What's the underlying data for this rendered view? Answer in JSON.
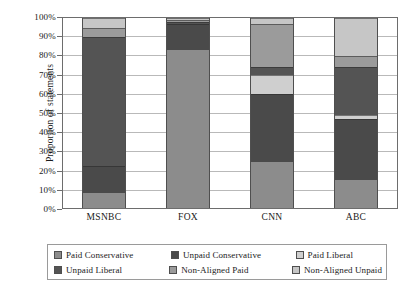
{
  "chart_data": {
    "type": "bar",
    "stacked": true,
    "title": "",
    "xlabel": "",
    "ylabel": "Proportion of statements",
    "ylim": [
      0,
      100
    ],
    "grid": true,
    "legend_position": "bottom",
    "categories": [
      "MSNBC",
      "FOX",
      "CNN",
      "ABC"
    ],
    "ytick_labels": [
      "0%",
      "10%",
      "20%",
      "30%",
      "40%",
      "50%",
      "60%",
      "70%",
      "80%",
      "90%",
      "100%"
    ],
    "ytick_values": [
      0,
      10,
      20,
      30,
      40,
      50,
      60,
      70,
      80,
      90,
      100
    ],
    "series": [
      {
        "name": "Paid Conservative",
        "color": "#8c8c8c",
        "values": [
          8,
          83,
          24,
          15
        ]
      },
      {
        "name": "Unpaid Conservative",
        "color": "#4a4a4a",
        "values": [
          14,
          14,
          36,
          32
        ]
      },
      {
        "name": "Paid Liberal",
        "color": "#cfcfcf",
        "values": [
          0,
          0,
          10,
          2
        ]
      },
      {
        "name": "Unpaid Liberal",
        "color": "#545454",
        "values": [
          68,
          1,
          4,
          25
        ]
      },
      {
        "name": "Non-Aligned Paid",
        "color": "#9b9b9b",
        "values": [
          5,
          1,
          23,
          6
        ]
      },
      {
        "name": "Non-Aligned Unpaid",
        "color": "#c6c6c6",
        "values": [
          5,
          1,
          3,
          20
        ]
      }
    ]
  },
  "legend": {
    "entries": [
      {
        "label": "Paid Conservative"
      },
      {
        "label": "Unpaid Conservative"
      },
      {
        "label": "Paid Liberal"
      },
      {
        "label": "Unpaid Liberal"
      },
      {
        "label": "Non-Aligned Paid"
      },
      {
        "label": "Non-Aligned Unpaid"
      }
    ]
  }
}
